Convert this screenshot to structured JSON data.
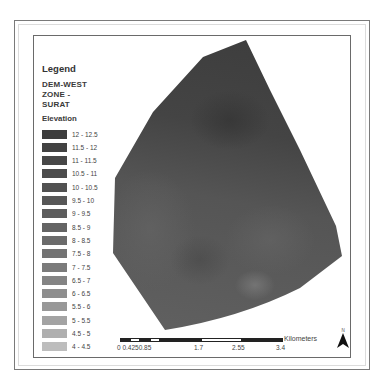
{
  "legend": {
    "title": "Legend",
    "layer_name": "DEM-WEST\nZONE -\nSURAT",
    "field": "Elevation",
    "classes": [
      {
        "label": "12 - 12.5",
        "color": "#3d3d3d"
      },
      {
        "label": "11.5 - 12",
        "color": "#424242"
      },
      {
        "label": "11 - 11.5",
        "color": "#474747"
      },
      {
        "label": "10.5 - 11",
        "color": "#4c4c4c"
      },
      {
        "label": "10 - 10.5",
        "color": "#515151"
      },
      {
        "label": "9.5 - 10",
        "color": "#575757"
      },
      {
        "label": "9 - 9.5",
        "color": "#5d5d5d"
      },
      {
        "label": "8.5 - 9",
        "color": "#646464"
      },
      {
        "label": "8 - 8.5",
        "color": "#6b6b6b"
      },
      {
        "label": "7.5 - 8",
        "color": "#737373"
      },
      {
        "label": "7 - 7.5",
        "color": "#7b7b7b"
      },
      {
        "label": "6.5 - 7",
        "color": "#848484"
      },
      {
        "label": "6 - 6.5",
        "color": "#8e8e8e"
      },
      {
        "label": "5.5 - 6",
        "color": "#989898"
      },
      {
        "label": "5 - 5.5",
        "color": "#a3a3a3"
      },
      {
        "label": "4.5 - 5",
        "color": "#afafaf"
      },
      {
        "label": "4 - 4.5",
        "color": "#bdbdbd"
      }
    ]
  },
  "scalebar": {
    "unit": "Kilometers",
    "ticks": [
      "0",
      "0.425",
      "0.85",
      "1.7",
      "2.55",
      "3.4"
    ],
    "tick_text": "0 0.4250.85"
  },
  "north_arrow": {
    "label": "N",
    "icon": "north-arrow-icon"
  },
  "map": {
    "layer": "DEM-WEST ZONE - SURAT",
    "dark_color": "#3f3f3f",
    "mid_color": "#5a5a5a",
    "light_color": "#6e6e6e"
  }
}
